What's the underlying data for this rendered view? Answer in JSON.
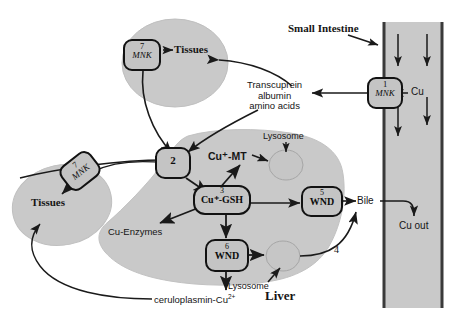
{
  "diagram": {
    "title_region": "Copper metabolism pathway: small intestine, blood, liver and tissues",
    "colors": {
      "organ_fill": "#c9c9c9",
      "organ_stroke": "#b3b3b3",
      "box_fill": "#c4c4c4",
      "box_stroke": "#121212",
      "line": "#1a1a1a",
      "text": "#121212",
      "background": "#ffffff"
    },
    "organs": {
      "small_intestine": "Small Intestine",
      "liver": "Liver",
      "tissues_top": "Tissues",
      "tissues_left": "Tissues"
    },
    "transporter_boxes": [
      {
        "id": "box1",
        "number": "1",
        "gene": "MNK",
        "location": "small-intestine"
      },
      {
        "id": "box7top",
        "number": "7",
        "gene": "MNK",
        "location": "tissues-top"
      },
      {
        "id": "box7left",
        "number": "7",
        "gene": "MNK",
        "location": "tissues-left"
      },
      {
        "id": "box2",
        "number": "2",
        "gene": "",
        "location": "liver-uptake"
      },
      {
        "id": "box3",
        "number": "3",
        "gene": "Cu⁺-GSH",
        "location": "liver-cytosol"
      },
      {
        "id": "box5",
        "number": "5",
        "gene": "WND",
        "location": "liver-bile"
      },
      {
        "id": "box6",
        "number": "6",
        "gene": "WND",
        "location": "liver-lysosome"
      }
    ],
    "labels": {
      "cu_in": "Cu",
      "cu_out": "Cu out",
      "bile": "Bile",
      "step4": "4",
      "transcuprein": [
        "Transcuprein",
        "albumin",
        "amino acids"
      ],
      "cu_mt": "Cu⁺-MT",
      "cu_enzymes": "Cu-Enzymes",
      "lysosome_top": "Lysosome",
      "lysosome_bottom": "Lysosome",
      "ceruloplasmin": "ceruloplasmin-Cu",
      "ceruloplasmin_charge": "2+",
      "cu_gsh_plus": "+",
      "cu_mt_plus": "+"
    },
    "icons": {
      "arrowhead": "arrowhead-icon",
      "intestine_flow": "down-arrow-icon"
    }
  }
}
